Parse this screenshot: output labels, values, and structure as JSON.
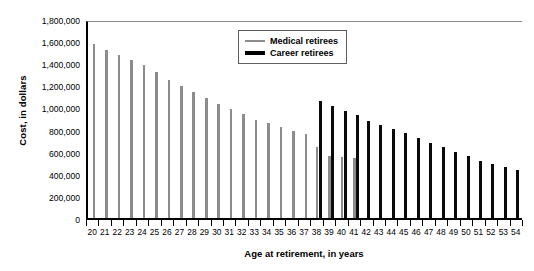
{
  "chart_data": {
    "type": "bar",
    "title": "",
    "xlabel": "Age at retirement, in years",
    "ylabel": "Cost, in dollars",
    "categories": [
      20,
      21,
      22,
      23,
      24,
      25,
      26,
      27,
      28,
      29,
      30,
      31,
      32,
      33,
      34,
      35,
      36,
      37,
      38,
      39,
      40,
      41,
      42,
      43,
      44,
      45,
      46,
      47,
      48,
      49,
      50,
      51,
      52,
      53,
      54
    ],
    "ylim": [
      0,
      1800000
    ],
    "ytick_values": [
      0,
      200000,
      400000,
      600000,
      800000,
      1000000,
      1200000,
      1400000,
      1600000,
      1800000
    ],
    "ytick_labels": [
      "0",
      "200,000",
      "400,000",
      "600,000",
      "800,000",
      "1,000,000",
      "1,200,000",
      "1,400,000",
      "1,600,000",
      "1,800,000"
    ],
    "grid": false,
    "legend_position": "top-right",
    "series": [
      {
        "name": "Medical retirees",
        "color": "#8c8c8c",
        "values": [
          1575000,
          1520000,
          1470000,
          1430000,
          1380000,
          1325000,
          1250000,
          1190000,
          1140000,
          1090000,
          1035000,
          985000,
          940000,
          890000,
          855000,
          820000,
          790000,
          760000,
          640000,
          560000,
          555000,
          540000,
          null,
          null,
          null,
          null,
          null,
          null,
          null,
          null,
          null,
          null,
          null,
          null,
          null
        ]
      },
      {
        "name": "Career retirees",
        "color": "#0a0a0a",
        "values": [
          null,
          null,
          null,
          null,
          null,
          null,
          null,
          null,
          null,
          null,
          null,
          null,
          null,
          null,
          null,
          null,
          null,
          null,
          1060000,
          1010000,
          965000,
          930000,
          880000,
          840000,
          805000,
          765000,
          720000,
          680000,
          640000,
          600000,
          560000,
          520000,
          490000,
          460000,
          430000
        ]
      }
    ]
  },
  "legend": {
    "items": [
      {
        "label": "Medical retirees",
        "swatch": "medical"
      },
      {
        "label": "Career retirees",
        "swatch": "career"
      }
    ]
  }
}
